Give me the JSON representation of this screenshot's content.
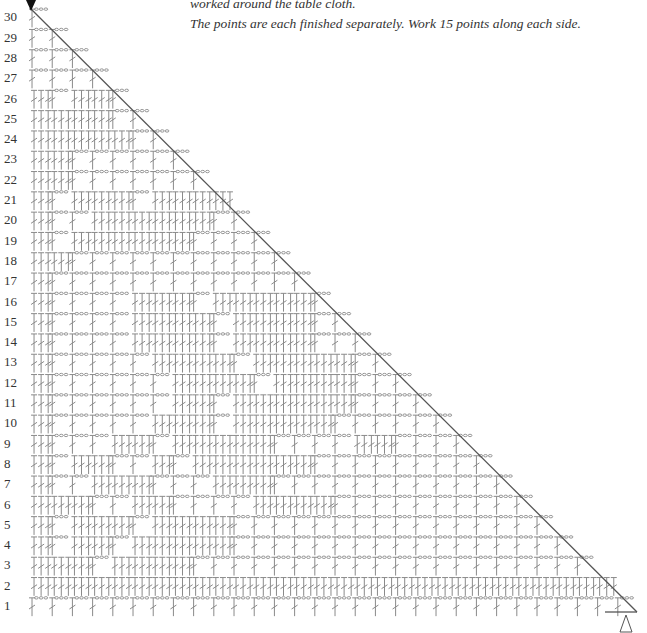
{
  "caption": {
    "line1": "worked around the table cloth.",
    "line2": "The points are each finished separately. Work 15 points along each side."
  },
  "markers": {
    "start_marker": "filled-down-triangle",
    "end_marker": "outline-up-triangle"
  },
  "colors": {
    "stitch": "#8a8a8a",
    "edge": "#555555",
    "label": "#333333"
  },
  "chart_data": {
    "type": "crochet-filet-chart",
    "row_labels": [
      1,
      2,
      3,
      4,
      5,
      6,
      7,
      8,
      9,
      10,
      11,
      12,
      13,
      14,
      15,
      16,
      17,
      18,
      19,
      20,
      21,
      22,
      23,
      24,
      25,
      26,
      27,
      28,
      29,
      30
    ],
    "legend": {
      "B": "block (double crochet group)",
      "S": "space (chain)"
    },
    "rows": {
      "1": "SSSSSSSSSSSSSSSSSSSSSSSSSSSSSS",
      "2": "BBBBBBBBBBBBBBBBBBBBBBBBBBBBB",
      "3": "BBBSBBBBSSSSSSSSSSSSSSSSSSSS",
      "4": "BSBBSBBBBBSSSSSSSSSSSSSSSSS",
      "5": "BSBBBSBBBBSSSSSSSSSSSSSSSS",
      "6": "BBBSSBBSSSSBBBBSSSSSSSSSS",
      "7": "BSSBBBSSSBBBSSSSSSSSSSSS",
      "8": "BSBBSSBSBBBBBBSSSSSSSSS",
      "9": "BSSSBBSBBBBBSSSSBBSSSS",
      "10": "BSSSSSBBBSBBBBBSSSSSS",
      "11": "BSSSSSSBBSBBBBBBSSSS",
      "12": "BSSSSSSBBBBSBBBBSSS",
      "13": "BSSSSSBBBBSBBBBBSS",
      "14": "BSSSSBBBBSBBBBSSS",
      "15": "BSSSSBBBBSBBBBSS",
      "16": "BSSSSBBBSBBBBBS",
      "17": "BSSSSSSSSSSSSS",
      "18": "BBSSSSSSSSSSS",
      "19": "BSBBBBBBSSSS",
      "20": "BSSBBBBBBSS",
      "21": "BSBBBSBBBB",
      "22": "BBSSSSSSS",
      "23": "BBSSSSSS",
      "24": "BBBBBSS",
      "25": "BBBBSS",
      "26": "BSBBS",
      "27": "SSSS",
      "28": "SSS",
      "29": "SS",
      "30": "S"
    },
    "layout": {
      "origin_x": 30,
      "row1_y": 607,
      "row_height": 20.3,
      "cell_width": 20.2,
      "diagonal_from": [
        30,
        8
      ],
      "diagonal_to": [
        637,
        612
      ]
    }
  }
}
